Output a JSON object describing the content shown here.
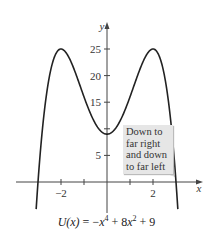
{
  "chart_data": {
    "type": "line",
    "caption_parts": {
      "fn": "U(x)",
      "eq": " = −",
      "x1": "x",
      "p1": "4",
      "mid": " + 8",
      "x2": "x",
      "p2": "2",
      "end": " + 9"
    },
    "xlabel": "x",
    "ylabel": "y",
    "function": "-x^4 + 8x^2 + 9",
    "xlim": [
      -3.2,
      4.0
    ],
    "ylim": [
      -5.8,
      28
    ],
    "x_ticks": [
      -2,
      -1,
      1,
      2
    ],
    "x_tick_labels": [
      "-2",
      "2"
    ],
    "y_ticks": [
      5,
      10,
      15,
      20,
      25
    ],
    "y_tick_labels": [
      "5",
      "10",
      "15",
      "20",
      "25"
    ],
    "grid": false,
    "key_points": [
      {
        "x": -2,
        "y": 25,
        "label": "local max"
      },
      {
        "x": 0,
        "y": 9,
        "label": "local min"
      },
      {
        "x": 2,
        "y": 25,
        "label": "local max"
      },
      {
        "x": -3,
        "y": 0,
        "label": "x-intercept"
      },
      {
        "x": 3,
        "y": 0,
        "label": "x-intercept"
      }
    ],
    "annotations": [
      {
        "text": "Down to far right and down to far left",
        "lines": [
          "Down to",
          "far right",
          "and down",
          "to far left"
        ],
        "points_to": {
          "x": 3,
          "y": 0
        }
      }
    ]
  },
  "labels": {
    "x_axis": "x",
    "y_axis": "y",
    "x_tick_neg2": "−2",
    "x_tick_2": "2",
    "y_tick_5": "5",
    "y_tick_15": "15",
    "y_tick_20": "20",
    "y_tick_25": "25"
  },
  "callout": {
    "line1": "Down to",
    "line2": "far right",
    "line3": "and down",
    "line4": "to far left"
  },
  "colors": {
    "curve": "#222222",
    "axis": "#333333",
    "callout_bg": "#e6e6e6"
  }
}
